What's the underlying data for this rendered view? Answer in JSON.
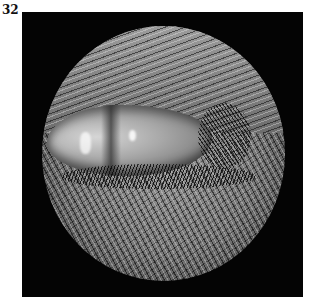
{
  "figure": {
    "label": "32",
    "image_alt": "Close-up photograph of an animal eye, partially closed, surrounded by fur, viewed through a circular lens vignette on a black background",
    "colors": {
      "background": "#ffffff",
      "frame": "#040404",
      "label": "#111111"
    }
  }
}
